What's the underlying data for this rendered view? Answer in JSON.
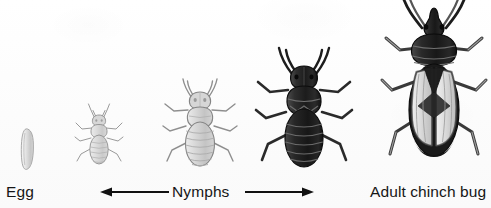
{
  "illustration": {
    "subject": "chinch bug life cycle",
    "style": "grayscale pencil illustration",
    "background_color": "#fdfdfd",
    "ink_color": "#161616"
  },
  "labels": {
    "egg": "Egg",
    "nymphs": "Nymphs",
    "adult": "Adult chinch bug"
  },
  "arrow": {
    "name": "nymphs-range-arrow",
    "style": "double-headed",
    "color": "#111111"
  },
  "stages": [
    {
      "id": "egg",
      "name": "egg",
      "label": "Egg",
      "body_color": "#e2e2e2",
      "outline_color": "#9a9a9a",
      "relative_size": "smallest"
    },
    {
      "id": "nymph-1",
      "name": "first-instar-nymph",
      "label": "Nymph",
      "body_color": "#dcdcdc",
      "outline_color": "#8e8e8e",
      "relative_size": "small"
    },
    {
      "id": "nymph-2",
      "name": "second-instar-nymph",
      "label": "Nymph",
      "body_color": "#d3d3d3",
      "outline_color": "#8a8a8a",
      "relative_size": "medium"
    },
    {
      "id": "nymph-3",
      "name": "third-instar-nymph",
      "label": "Nymph",
      "body_color": "#2a2a2a",
      "outline_color": "#111111",
      "relative_size": "large"
    },
    {
      "id": "adult",
      "name": "adult-chinch-bug",
      "label": "Adult chinch bug",
      "body_color": "#262626",
      "wing_color": "#d8d8d8",
      "outline_color": "#111111",
      "relative_size": "largest"
    }
  ]
}
